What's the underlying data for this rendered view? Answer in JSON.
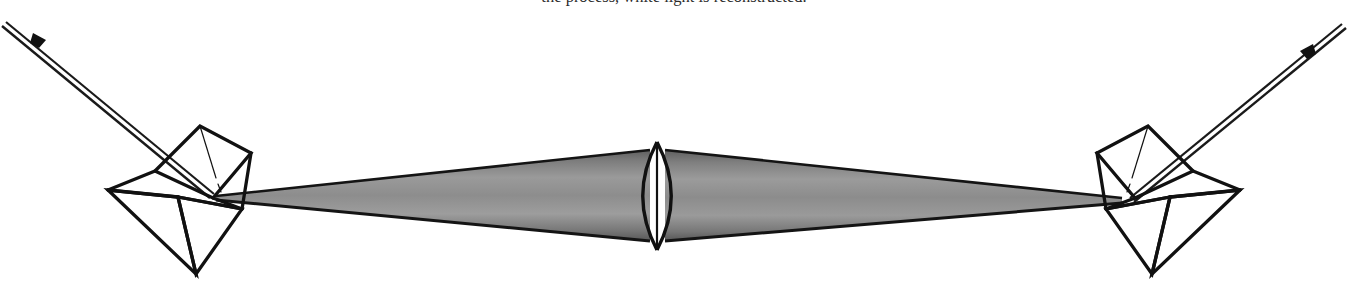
{
  "page": {
    "background_color": "#ffffff",
    "width": 1348,
    "height": 303
  },
  "caption": {
    "text": "the process, white light is reconstructed.",
    "color": "#2b2b2b",
    "clipped": "true"
  },
  "figure": {
    "ink_color": "#111111",
    "beam": {
      "fill_center_color": "#8f8f8f",
      "fill_edge_color": "#6d6d6d",
      "outline_color": "#141414",
      "left_focus_x": 216,
      "left_focus_y": 196,
      "right_focus_x": 1122,
      "right_focus_y": 201,
      "lens_center_x": 657,
      "lens_top_y": 152,
      "lens_bottom_y": 238
    },
    "lens": {
      "name": "biconvex-lens",
      "center_x": 657,
      "top_y": 142,
      "bottom_y": 250,
      "half_width": 17,
      "stroke_color": "#111111"
    },
    "left_prism": {
      "name": "left-prism",
      "label_hint": "dispersing prism, left"
    },
    "right_prism": {
      "name": "right-prism",
      "label_hint": "dispersing prism, right"
    },
    "left_ray": {
      "name": "left-incident-ray",
      "start_x": 2,
      "start_y": 28,
      "end_x": 212,
      "end_y": 200,
      "arrow_x": 39,
      "arrow_y": 39
    },
    "right_ray": {
      "name": "right-emergent-ray",
      "start_x": 1344,
      "start_y": 30,
      "end_x": 1132,
      "end_y": 204,
      "arrow_x": 1306,
      "arrow_y": 51
    }
  }
}
